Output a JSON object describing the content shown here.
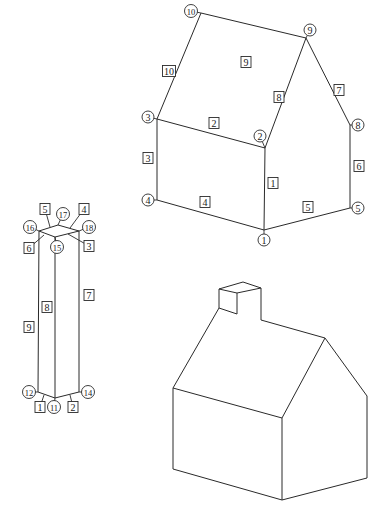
{
  "figures": [
    {
      "id": "labeled-house",
      "description": "Wireframe house with numbered vertices (circles) and numbered edges (squares)",
      "vertices": [
        {
          "label": "1",
          "x": 264,
          "y": 230,
          "lx": 264,
          "ly": 240
        },
        {
          "label": "2",
          "x": 265,
          "y": 148,
          "lx": 260,
          "ly": 136
        },
        {
          "label": "3",
          "x": 157,
          "y": 119,
          "lx": 148,
          "ly": 117
        },
        {
          "label": "4",
          "x": 157,
          "y": 200,
          "lx": 148,
          "ly": 200
        },
        {
          "label": "5",
          "x": 350,
          "y": 208,
          "lx": 358,
          "ly": 208
        },
        {
          "label": "8",
          "x": 350,
          "y": 125,
          "lx": 358,
          "ly": 125
        },
        {
          "label": "9",
          "x": 306,
          "y": 38,
          "lx": 310,
          "ly": 30
        },
        {
          "label": "10",
          "x": 201,
          "y": 13,
          "lx": 191,
          "ly": 11
        }
      ],
      "edges": [
        {
          "label": "1",
          "from": "1",
          "to": "2",
          "lx": 273,
          "ly": 183
        },
        {
          "label": "2",
          "from": "2",
          "to": "3",
          "lx": 214,
          "ly": 123
        },
        {
          "label": "3",
          "from": "3",
          "to": "4",
          "lx": 148,
          "ly": 158
        },
        {
          "label": "4",
          "from": "4",
          "to": "1",
          "lx": 205,
          "ly": 202
        },
        {
          "label": "5",
          "from": "1",
          "to": "5",
          "lx": 308,
          "ly": 207
        },
        {
          "label": "6",
          "from": "5",
          "to": "8",
          "lx": 359,
          "ly": 166
        },
        {
          "label": "7",
          "from": "8",
          "to": "9",
          "lx": 339,
          "ly": 90
        },
        {
          "label": "8",
          "from": "2",
          "to": "9",
          "lx": 279,
          "ly": 97
        },
        {
          "label": "9",
          "from": "9",
          "to": "10",
          "lx": 246,
          "ly": 62
        },
        {
          "label": "10",
          "from": "10",
          "to": "3",
          "lx": 169,
          "ly": 71
        }
      ]
    },
    {
      "id": "labeled-column",
      "description": "Wireframe rectangular prism with numbered vertices and edges",
      "vertices": [
        {
          "label": "11",
          "x": 55,
          "y": 398,
          "lx": 54,
          "ly": 407
        },
        {
          "label": "12",
          "x": 38,
          "y": 392,
          "lx": 29,
          "ly": 392
        },
        {
          "label": "14",
          "x": 79,
          "y": 392,
          "lx": 88,
          "ly": 392
        },
        {
          "label": "15",
          "x": 55,
          "y": 237,
          "lx": 57,
          "ly": 247
        },
        {
          "label": "16",
          "x": 39,
          "y": 231,
          "lx": 30,
          "ly": 227
        },
        {
          "label": "17",
          "x": 58,
          "y": 225,
          "lx": 63,
          "ly": 214
        },
        {
          "label": "18",
          "x": 79,
          "y": 231,
          "lx": 89,
          "ly": 227
        }
      ],
      "edges": [
        {
          "label": "1",
          "from": "12",
          "to": "11",
          "lx": 40,
          "ly": 407,
          "ax": 44,
          "ay": 395
        },
        {
          "label": "2",
          "from": "11",
          "to": "14",
          "lx": 73,
          "ly": 407,
          "ax": 70,
          "ay": 395
        },
        {
          "label": "3",
          "from": "15",
          "to": "18",
          "lx": 89,
          "ly": 246,
          "ax": 68,
          "ay": 234
        },
        {
          "label": "4",
          "from": "17",
          "to": "18",
          "lx": 84,
          "ly": 209,
          "ax": 70,
          "ay": 228
        },
        {
          "label": "5",
          "from": "16",
          "to": "17",
          "lx": 45,
          "ly": 209,
          "ax": 50,
          "ay": 227
        },
        {
          "label": "6",
          "from": "16",
          "to": "15",
          "lx": 29,
          "ly": 248,
          "ax": 44,
          "ay": 235
        },
        {
          "label": "7",
          "from": "18",
          "to": "14",
          "lx": 89,
          "ly": 295
        },
        {
          "label": "8",
          "from": "15",
          "to": "11",
          "lx": 47,
          "ly": 307
        },
        {
          "label": "9",
          "from": "16",
          "to": "12",
          "lx": 29,
          "ly": 327
        }
      ],
      "extra_lines": [
        {
          "from": "12",
          "to": "11"
        },
        {
          "from": "11",
          "to": "14"
        },
        {
          "from": "14",
          "to": "18"
        }
      ]
    },
    {
      "id": "plain-house-with-chimney",
      "description": "Unlabeled wireframe house with chimney",
      "polylines": [
        [
          [
            173,
            469
          ],
          [
            282,
            500
          ],
          [
            367,
            478
          ],
          [
            367,
            396
          ],
          [
            325,
            338
          ],
          [
            282,
            418
          ],
          [
            173,
            388
          ],
          [
            173,
            469
          ]
        ],
        [
          [
            282,
            418
          ],
          [
            282,
            500
          ]
        ],
        [
          [
            173,
            388
          ],
          [
            219,
            308
          ],
          [
            237,
            314
          ]
        ],
        [
          [
            261,
            320
          ],
          [
            325,
            338
          ]
        ],
        [
          [
            219,
            308
          ],
          [
            219,
            289
          ],
          [
            243,
            282
          ],
          [
            261,
            288
          ],
          [
            237,
            293
          ],
          [
            219,
            289
          ]
        ],
        [
          [
            237,
            293
          ],
          [
            237,
            314
          ]
        ],
        [
          [
            261,
            288
          ],
          [
            261,
            320
          ]
        ]
      ]
    }
  ]
}
